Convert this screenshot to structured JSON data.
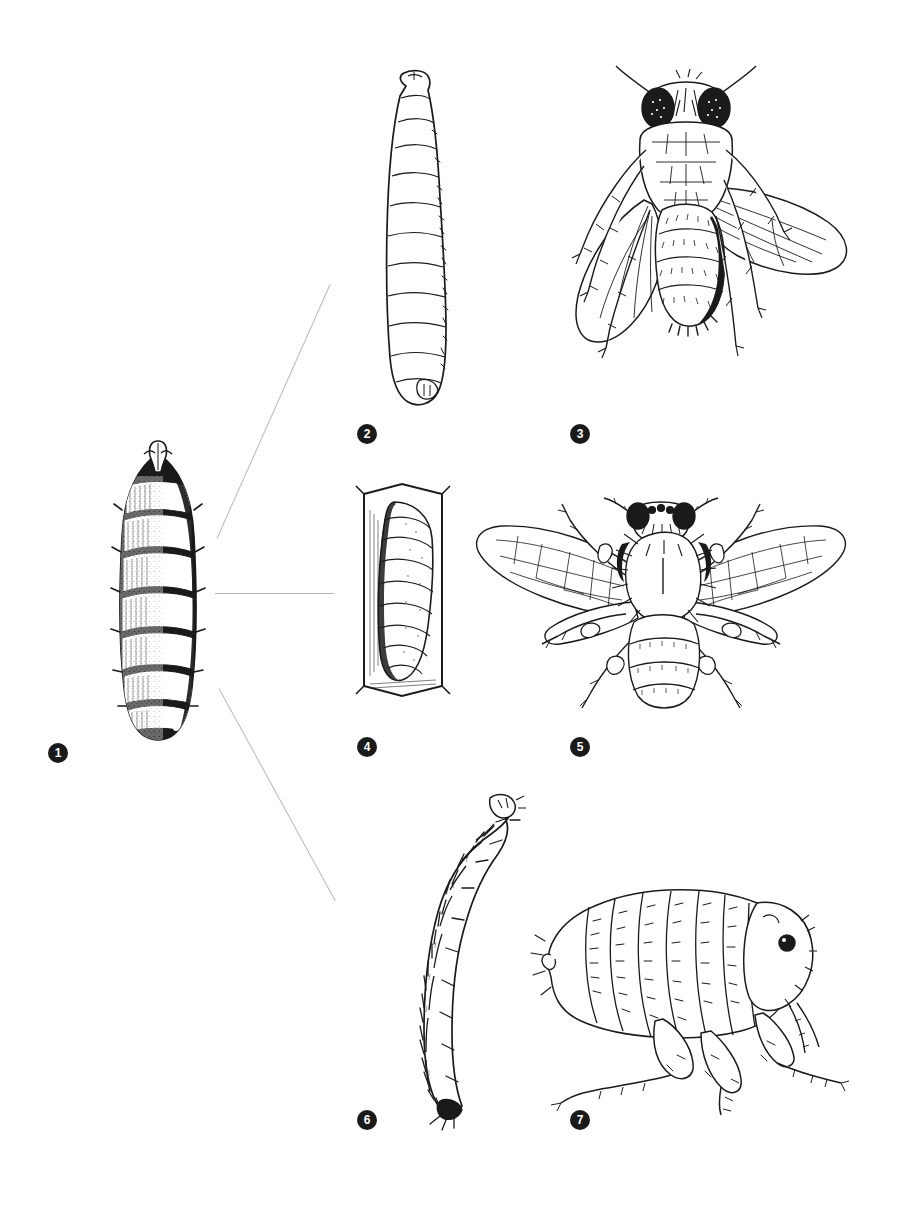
{
  "plate": {
    "title": "Insect life-cycle comparison plate",
    "description": "Line-drawing plate: a large central stippled puparium connected by three leader lines to three pairs of larva-and-adult illustrations (fly, bee, flea).",
    "background_color": "#ffffff",
    "ink_color": "#1a1a1a",
    "connector_color": "#b9b9b9"
  },
  "figures": [
    {
      "number": "1",
      "label": "1",
      "name": "puparium",
      "caption": "Puparium",
      "row": "center",
      "column": "left"
    },
    {
      "number": "2",
      "label": "2",
      "name": "fly-larva",
      "caption": "Fly larva (maggot)",
      "row": "top",
      "column": "middle"
    },
    {
      "number": "3",
      "label": "3",
      "name": "adult-fly",
      "caption": "Adult fly",
      "row": "top",
      "column": "right"
    },
    {
      "number": "4",
      "label": "4",
      "name": "bee-larva-in-cell",
      "caption": "Bee larva in comb cell",
      "row": "middle",
      "column": "middle"
    },
    {
      "number": "5",
      "label": "5",
      "name": "adult-bee",
      "caption": "Adult bee",
      "row": "middle",
      "column": "right"
    },
    {
      "number": "6",
      "label": "6",
      "name": "flea-larva",
      "caption": "Flea larva",
      "row": "bottom",
      "column": "middle"
    },
    {
      "number": "7",
      "label": "7",
      "name": "adult-flea",
      "caption": "Adult flea",
      "row": "bottom",
      "column": "right"
    }
  ],
  "connectors": [
    {
      "name": "connector-to-top-row",
      "from": "1",
      "to": "2"
    },
    {
      "name": "connector-to-middle-row",
      "from": "1",
      "to": "4"
    },
    {
      "name": "connector-to-bottom-row",
      "from": "1",
      "to": "6"
    }
  ]
}
